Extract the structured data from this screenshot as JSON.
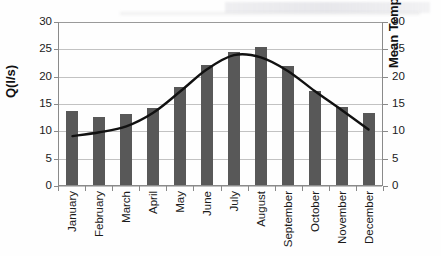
{
  "chart_data": {
    "type": "bar",
    "title": "",
    "xlabel": "",
    "ylabel": "Q(l/s)",
    "y2label": "Mean Temp.(°C)",
    "ylim": [
      0,
      30
    ],
    "y2lim": [
      0,
      30
    ],
    "ytick_step": 5,
    "grid": "horizontal",
    "legend": "none",
    "categories": [
      "January",
      "February",
      "March",
      "April",
      "May",
      "June",
      "July",
      "August",
      "September",
      "October",
      "November",
      "December"
    ],
    "yticks": [
      "0",
      "5",
      "10",
      "15",
      "20",
      "25",
      "30"
    ],
    "y2ticks": [
      "0",
      "5",
      "10",
      "15",
      "20",
      "25",
      "30"
    ],
    "series": [
      {
        "name": "Q(l/s)",
        "type": "bar",
        "axis": "left",
        "color": "#585858",
        "values": [
          13.5,
          12.5,
          13.0,
          14.0,
          18.0,
          22.0,
          24.3,
          25.2,
          21.7,
          17.2,
          14.3,
          13.2
        ]
      },
      {
        "name": "Mean Temp.(°C)",
        "type": "line",
        "axis": "right",
        "color": "#111111",
        "values": [
          9.0,
          9.7,
          10.8,
          13.3,
          17.2,
          21.3,
          23.9,
          23.5,
          21.0,
          17.3,
          13.8,
          10.2
        ]
      }
    ]
  }
}
